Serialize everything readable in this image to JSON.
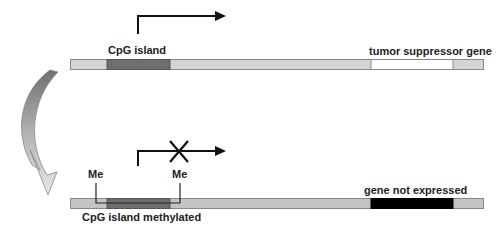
{
  "top": {
    "cpg_label": "CpG island",
    "gene_label": "tumor suppressor gene"
  },
  "bottom": {
    "me_left": "Me",
    "me_right": "Me",
    "cpg_label": "CpG island methylated",
    "gene_label": "gene not expressed"
  },
  "colors": {
    "bar": "#d4d4d4",
    "cpg": "#6e6e6e",
    "gene_active": "#ffffff",
    "gene_silenced": "#000000",
    "bottom_bar": "#c4c4c4"
  }
}
